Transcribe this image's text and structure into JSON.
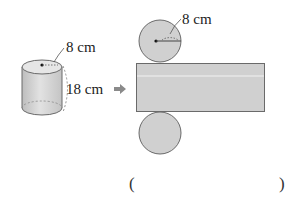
{
  "cylinder": {
    "radius_label": "8 cm",
    "height_label": "18 cm"
  },
  "arrow": {
    "symbol": "➡"
  },
  "net": {
    "top_circle_radius_label": "8 cm"
  },
  "answer": {
    "open_paren": "(",
    "close_paren": ")"
  },
  "colors": {
    "fill": "#d0d0d0",
    "stroke": "#6a6a6a",
    "text": "#222222",
    "arrow": "#8a8a8a"
  }
}
